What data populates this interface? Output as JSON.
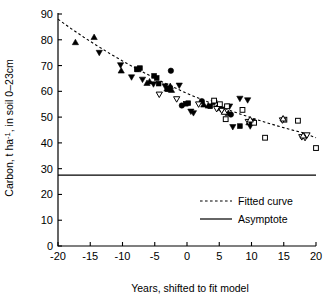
{
  "chart_data": {
    "type": "scatter",
    "title": "",
    "xlabel": "Years, shifted to fit model",
    "ylabel": "Carbon, t ha-1, in soil 0-23cm",
    "ylabel_parts": {
      "pre": "Carbon, t ha",
      "sup": "-1",
      "post": ", in soil 0–23cm"
    },
    "xlim": [
      -20,
      20
    ],
    "ylim": [
      0,
      90
    ],
    "xticks": [
      -20,
      -15,
      -10,
      -5,
      0,
      5,
      10,
      15,
      20
    ],
    "xticklabels": [
      "-20",
      "-15",
      "-10",
      "-5",
      "0",
      "5",
      "10",
      "15",
      "20"
    ],
    "yticks": [
      0,
      10,
      20,
      30,
      40,
      50,
      60,
      70,
      80,
      90
    ],
    "yticklabels": [
      "0",
      "10",
      "20",
      "30",
      "40",
      "50",
      "60",
      "70",
      "80",
      "90"
    ],
    "grid": false,
    "legend_position": "center-right-lower",
    "legend": [
      {
        "label": "Fitted curve",
        "style": "dotted"
      },
      {
        "label": "Asymptote",
        "style": "solid"
      }
    ],
    "asymptote_value": 27.5,
    "fitted_curve": [
      {
        "x": -20,
        "y": 88.0
      },
      {
        "x": -18,
        "y": 84.4
      },
      {
        "x": -16,
        "y": 81.0
      },
      {
        "x": -14,
        "y": 77.8
      },
      {
        "x": -12,
        "y": 74.7
      },
      {
        "x": -10,
        "y": 71.8
      },
      {
        "x": -8,
        "y": 69.0
      },
      {
        "x": -6,
        "y": 66.4
      },
      {
        "x": -4,
        "y": 63.9
      },
      {
        "x": -2,
        "y": 61.5
      },
      {
        "x": 0,
        "y": 59.2
      },
      {
        "x": 2,
        "y": 57.1
      },
      {
        "x": 4,
        "y": 55.1
      },
      {
        "x": 6,
        "y": 53.2
      },
      {
        "x": 8,
        "y": 51.4
      },
      {
        "x": 10,
        "y": 49.7
      },
      {
        "x": 12,
        "y": 48.1
      },
      {
        "x": 14,
        "y": 46.6
      },
      {
        "x": 16,
        "y": 45.2
      },
      {
        "x": 18,
        "y": 43.9
      },
      {
        "x": 20,
        "y": 42.0
      }
    ],
    "series": [
      {
        "name": "filled-up-triangle",
        "marker": "triangle-up",
        "filled": true,
        "points": [
          {
            "x": -17.3,
            "y": 79.0
          },
          {
            "x": -14.4,
            "y": 81.0
          },
          {
            "x": -10.2,
            "y": 68.0
          },
          {
            "x": -7.6,
            "y": 68.5
          },
          {
            "x": -6.2,
            "y": 63.2
          },
          {
            "x": -5.8,
            "y": 63.8
          },
          {
            "x": -3.1,
            "y": 61.0
          },
          {
            "x": -2.6,
            "y": 62.0
          },
          {
            "x": -2.4,
            "y": 60.5
          },
          {
            "x": 2.6,
            "y": 54.8
          },
          {
            "x": 3.3,
            "y": 54.4
          },
          {
            "x": 6.4,
            "y": 51.5
          },
          {
            "x": 9.6,
            "y": 47.9
          }
        ]
      },
      {
        "name": "filled-down-triangle",
        "marker": "triangle-down",
        "filled": true,
        "points": [
          {
            "x": -13.6,
            "y": 75.0
          },
          {
            "x": -10.3,
            "y": 70.2
          },
          {
            "x": -8.6,
            "y": 65.5
          },
          {
            "x": -6.9,
            "y": 64.6
          },
          {
            "x": -5.2,
            "y": 62.8
          },
          {
            "x": -3.4,
            "y": 62.0
          },
          {
            "x": -2.7,
            "y": 61.2
          },
          {
            "x": -1.2,
            "y": 62.3
          },
          {
            "x": 0.6,
            "y": 52.2
          },
          {
            "x": 1.0,
            "y": 51.6
          },
          {
            "x": 4.2,
            "y": 55.6
          },
          {
            "x": 6.6,
            "y": 54.2
          },
          {
            "x": 8.2,
            "y": 57.2
          },
          {
            "x": 9.4,
            "y": 56.6
          },
          {
            "x": 7.1,
            "y": 46.2
          },
          {
            "x": 9.8,
            "y": 46.5
          },
          {
            "x": 10.1,
            "y": 48.4
          }
        ]
      },
      {
        "name": "filled-square",
        "marker": "square",
        "filled": true,
        "points": [
          {
            "x": -7.8,
            "y": 68.6
          },
          {
            "x": -7.3,
            "y": 69.0
          },
          {
            "x": -5.1,
            "y": 66.0
          },
          {
            "x": -4.7,
            "y": 65.2
          },
          {
            "x": -4.4,
            "y": 63.0
          },
          {
            "x": -3.0,
            "y": 60.8
          },
          {
            "x": -0.2,
            "y": 55.2
          },
          {
            "x": 0.2,
            "y": 55.4
          },
          {
            "x": 3.6,
            "y": 54.2
          },
          {
            "x": 5.5,
            "y": 53.0
          },
          {
            "x": 8.2,
            "y": 46.5
          }
        ]
      },
      {
        "name": "filled-circle",
        "marker": "circle",
        "filled": true,
        "points": [
          {
            "x": -2.5,
            "y": 68.0
          },
          {
            "x": -0.8,
            "y": 54.5
          },
          {
            "x": 2.3,
            "y": 56.2
          },
          {
            "x": 5.0,
            "y": 53.6
          },
          {
            "x": 6.8,
            "y": 51.0
          },
          {
            "x": 9.9,
            "y": 48.0
          }
        ]
      },
      {
        "name": "open-square",
        "marker": "square",
        "filled": false,
        "points": [
          {
            "x": 4.2,
            "y": 56.4
          },
          {
            "x": 5.1,
            "y": 55.0
          },
          {
            "x": 6.0,
            "y": 49.2
          },
          {
            "x": 6.2,
            "y": 54.2
          },
          {
            "x": 8.6,
            "y": 52.8
          },
          {
            "x": 12.1,
            "y": 42.0
          },
          {
            "x": 15.1,
            "y": 49.0
          },
          {
            "x": 17.2,
            "y": 48.6
          },
          {
            "x": 20.0,
            "y": 38.0
          },
          {
            "x": 10.4,
            "y": 47.8
          }
        ]
      },
      {
        "name": "open-down-triangle",
        "marker": "triangle-down",
        "filled": false,
        "points": [
          {
            "x": -4.3,
            "y": 58.8
          },
          {
            "x": -1.6,
            "y": 57.0
          },
          {
            "x": 1.8,
            "y": 55.0
          },
          {
            "x": 4.6,
            "y": 53.2
          },
          {
            "x": 5.4,
            "y": 52.5
          },
          {
            "x": 9.5,
            "y": 48.2
          },
          {
            "x": 14.8,
            "y": 48.8
          },
          {
            "x": 17.8,
            "y": 42.3
          },
          {
            "x": 18.3,
            "y": 42.0
          },
          {
            "x": 18.6,
            "y": 43.0
          }
        ]
      },
      {
        "name": "open-up-triangle",
        "marker": "triangle-up",
        "filled": false,
        "points": [
          {
            "x": 9.8,
            "y": 49.0
          },
          {
            "x": 14.9,
            "y": 49.4
          },
          {
            "x": 18.0,
            "y": 42.8
          },
          {
            "x": 5.8,
            "y": 52.0
          }
        ]
      }
    ]
  }
}
